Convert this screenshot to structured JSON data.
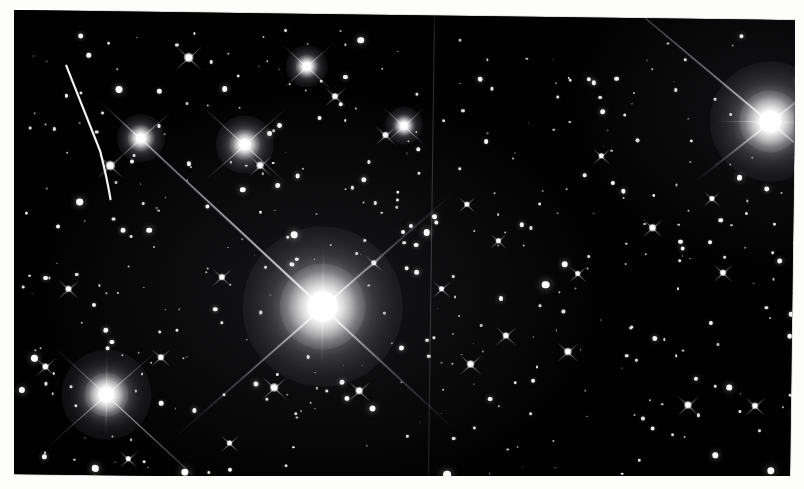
{
  "image": {
    "kind": "astronomical-photograph",
    "subject": "dense star field with bright diffraction-spiked stars",
    "color_mode": "black-and-white",
    "background_color": "#010102",
    "star_color": "#ffffff",
    "paper_color": "#fdfdfc",
    "width": 804,
    "height": 489,
    "print_rotation_deg": 0.75,
    "caption": "",
    "title": ""
  },
  "artifacts": {
    "seam": {
      "name": "vertical plate seam",
      "x": 420,
      "color": "#969698"
    },
    "streak": {
      "name": "curved satellite trail",
      "path": "M 53 55 Q 74 106 88 140 Q 95 166 99 188",
      "color": "#f2f2f2",
      "width": 2.2
    }
  },
  "bright_stars": [
    {
      "id": "alpha",
      "label": "central bright star",
      "x": 312,
      "y": 292,
      "core": 30,
      "halo": 86,
      "bloom": 160,
      "spikes": [
        {
          "angle": 222,
          "length": 310,
          "weight": "fat"
        },
        {
          "angle": 42,
          "length": 180,
          "weight": "fat"
        },
        {
          "angle": 138,
          "length": 200,
          "weight": "fat"
        },
        {
          "angle": 318,
          "length": 175,
          "weight": "fat"
        },
        {
          "angle": 270,
          "length": 60,
          "weight": "thin"
        },
        {
          "angle": 90,
          "length": 60,
          "weight": "thin"
        }
      ]
    },
    {
      "id": "beta",
      "label": "upper-right bright star",
      "x": 757,
      "y": 101,
      "core": 22,
      "halo": 62,
      "bloom": 120,
      "spikes": [
        {
          "angle": 219,
          "length": 150,
          "weight": "fat"
        },
        {
          "angle": 39,
          "length": 70,
          "weight": "fat"
        },
        {
          "angle": 141,
          "length": 95,
          "weight": "fat"
        },
        {
          "angle": 321,
          "length": 70,
          "weight": "fat"
        },
        {
          "angle": 180,
          "length": 55,
          "weight": "thin"
        },
        {
          "angle": 0,
          "length": 45,
          "weight": "thin"
        }
      ]
    },
    {
      "id": "gamma",
      "label": "lower-left bright star",
      "x": 97,
      "y": 383,
      "core": 15,
      "halo": 44,
      "bloom": 90,
      "spikes": [
        {
          "angle": 222,
          "length": 72,
          "weight": "thin"
        },
        {
          "angle": 42,
          "length": 95,
          "weight": "thin"
        },
        {
          "angle": 138,
          "length": 80,
          "weight": "thin"
        },
        {
          "angle": 318,
          "length": 70,
          "weight": "thin"
        },
        {
          "angle": 270,
          "length": 40,
          "weight": "thin"
        },
        {
          "angle": 90,
          "length": 40,
          "weight": "thin"
        }
      ]
    },
    {
      "id": "delta",
      "label": "mid-left spiked star",
      "x": 232,
      "y": 131,
      "core": 11,
      "halo": 30,
      "bloom": 58,
      "spikes": [
        {
          "angle": 222,
          "length": 62
        },
        {
          "angle": 42,
          "length": 58
        },
        {
          "angle": 138,
          "length": 55
        },
        {
          "angle": 318,
          "length": 58
        }
      ]
    },
    {
      "id": "epsilon",
      "label": "upper-left spiked star",
      "x": 128,
      "y": 126,
      "core": 9,
      "halo": 26,
      "bloom": 48,
      "spikes": [
        {
          "angle": 222,
          "length": 42
        },
        {
          "angle": 42,
          "length": 48
        },
        {
          "angle": 138,
          "length": 40
        },
        {
          "angle": 318,
          "length": 44
        }
      ]
    },
    {
      "id": "zeta",
      "label": "upper-mid spiked star",
      "x": 293,
      "y": 52,
      "core": 8,
      "halo": 22,
      "bloom": 42,
      "spikes": [
        {
          "angle": 222,
          "length": 34
        },
        {
          "angle": 42,
          "length": 36
        },
        {
          "angle": 138,
          "length": 32
        },
        {
          "angle": 318,
          "length": 34
        }
      ]
    },
    {
      "id": "eta",
      "label": "upper-right field star",
      "x": 391,
      "y": 110,
      "core": 7,
      "halo": 20,
      "bloom": 38,
      "spikes": [
        {
          "angle": 222,
          "length": 30
        },
        {
          "angle": 42,
          "length": 30
        },
        {
          "angle": 138,
          "length": 26
        },
        {
          "angle": 318,
          "length": 28
        }
      ]
    }
  ],
  "medium_stars": [
    {
      "x": 175,
      "y": 45,
      "r": 4.0
    },
    {
      "x": 248,
      "y": 152,
      "r": 3.4
    },
    {
      "x": 98,
      "y": 154,
      "r": 4.0
    },
    {
      "x": 322,
      "y": 82,
      "r": 3.0
    },
    {
      "x": 373,
      "y": 120,
      "r": 3.0
    },
    {
      "x": 265,
      "y": 374,
      "r": 3.8
    },
    {
      "x": 350,
      "y": 376,
      "r": 3.4
    },
    {
      "x": 461,
      "y": 348,
      "r": 3.4
    },
    {
      "x": 558,
      "y": 334,
      "r": 3.2
    },
    {
      "x": 679,
      "y": 386,
      "r": 3.4
    },
    {
      "x": 746,
      "y": 386,
      "r": 3.0
    },
    {
      "x": 641,
      "y": 209,
      "r": 3.2
    },
    {
      "x": 496,
      "y": 319,
      "r": 3.0
    },
    {
      "x": 211,
      "y": 264,
      "r": 2.8
    },
    {
      "x": 151,
      "y": 345,
      "r": 2.8
    },
    {
      "x": 58,
      "y": 278,
      "r": 3.0
    },
    {
      "x": 36,
      "y": 356,
      "r": 3.0
    },
    {
      "x": 712,
      "y": 253,
      "r": 2.8
    },
    {
      "x": 431,
      "y": 273,
      "r": 2.6
    },
    {
      "x": 567,
      "y": 256,
      "r": 2.6
    },
    {
      "x": 363,
      "y": 248,
      "r": 2.6
    },
    {
      "x": 221,
      "y": 430,
      "r": 2.6
    },
    {
      "x": 120,
      "y": 447,
      "r": 2.6
    },
    {
      "x": 589,
      "y": 138,
      "r": 2.6
    },
    {
      "x": 700,
      "y": 179,
      "r": 2.4
    },
    {
      "x": 455,
      "y": 188,
      "r": 2.4
    },
    {
      "x": 487,
      "y": 224,
      "r": 2.4
    }
  ],
  "field_star_count": 420,
  "field_star_seed": 20240917
}
